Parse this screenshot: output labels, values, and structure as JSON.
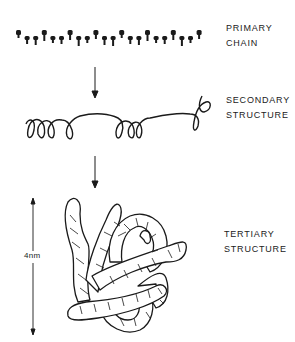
{
  "figure": {
    "stages": [
      {
        "label_line1": "PRIMARY",
        "label_line2": "CHAIN"
      },
      {
        "label_line1": "SECONDARY",
        "label_line2": "STRUCTURE"
      },
      {
        "label_line1": "TERTIARY",
        "label_line2": "STRUCTURE"
      }
    ],
    "scale_label": "4nm",
    "ink_color": "#1a1a1a"
  }
}
